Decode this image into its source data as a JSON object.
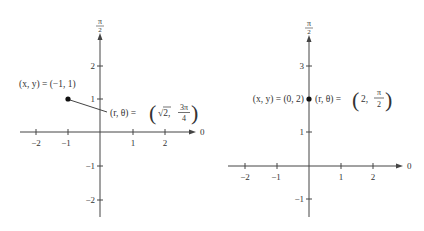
{
  "left_plot": {
    "axis_top_label": {
      "num": "π",
      "den": "2"
    },
    "axis_right_label": "0",
    "x_ticks": [
      "−2",
      "−1",
      "1",
      "2"
    ],
    "y_ticks": [
      "2",
      "1",
      "−1",
      "−2"
    ],
    "point": {
      "x": -1,
      "y": 1
    },
    "rect_label": "(x,  y)  =  (−1,  1)",
    "polar_label_prefix": "(r,  θ)  =",
    "polar_r": "√2,",
    "polar_theta": {
      "num": "3π",
      "den": "4"
    }
  },
  "right_plot": {
    "axis_top_label": {
      "num": "π",
      "den": "2"
    },
    "axis_right_label": "0",
    "x_ticks": [
      "−2",
      "−1",
      "1",
      "2"
    ],
    "y_ticks": [
      "3",
      "1",
      "−1"
    ],
    "point": {
      "x": 0,
      "y": 2
    },
    "rect_label": "(x,  y)  =  (0,  2)",
    "polar_label_prefix": "(r,  θ)  =",
    "polar_r": "2,",
    "polar_theta": {
      "num": "π",
      "den": "2"
    }
  }
}
